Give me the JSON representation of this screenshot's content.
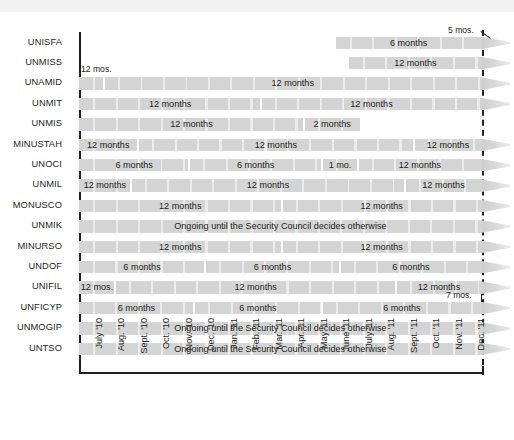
{
  "chart_data": {
    "type": "bar",
    "title": "",
    "subtitle": "",
    "xlabel": "",
    "ylabel": "",
    "orientation": "horizontal-gantt",
    "grid": false,
    "legend": "none",
    "x_axis": {
      "start": "July '10",
      "end": "Dec. '11",
      "tick_labels": [
        "July '10",
        "Aug. '10",
        "Sept. '10",
        "Oct. '10",
        "Nov. '10",
        "Dec. '10",
        "Jan. '11",
        "Feb. '11",
        "Mar. '11",
        "Apr. '11",
        "May '11",
        "June '11",
        "July '11",
        "Aug. '11",
        "Sept. '11",
        "Oct. '11",
        "Nov. '11",
        "Dec. '11"
      ]
    },
    "now_marker": {
      "label": "Dec. '11",
      "style": "dashed-vertical"
    },
    "categories": [
      "UNISFA",
      "UNMISS",
      "UNAMID",
      "UNMIT",
      "UNMIS",
      "MINUSTAH",
      "UNOCI",
      "UNMIL",
      "MONUSCO",
      "UNMIK",
      "MINURSO",
      "UNDOF",
      "UNIFIL",
      "UNFICYP",
      "UNMOGIP",
      "UNTSO"
    ],
    "rows": [
      {
        "mission": "UNISFA",
        "callout": {
          "text": "5 mos.",
          "leader": true
        },
        "continues": true,
        "segments": [
          {
            "label": "6 months",
            "start_month": 11.4,
            "end_month": 17.9,
            "months": 6
          }
        ]
      },
      {
        "mission": "UNMISS",
        "continues": true,
        "segments": [
          {
            "label": "12 months",
            "start_month": 12.0,
            "end_month": 17.9,
            "months": 12
          }
        ]
      },
      {
        "mission": "UNAMID",
        "callout": {
          "text": "12 mos.",
          "leader": false
        },
        "continues": true,
        "segments": [
          {
            "label": "",
            "start_month": 0.0,
            "end_month": 1.1,
            "months": 12
          },
          {
            "label": "12 months",
            "start_month": 1.1,
            "end_month": 17.9,
            "months": 12
          }
        ]
      },
      {
        "mission": "UNMIT",
        "continues": true,
        "segments": [
          {
            "label": "12 months",
            "start_month": 0.0,
            "end_month": 8.1,
            "months": 12
          },
          {
            "label": "12 months",
            "start_month": 8.1,
            "end_month": 17.9,
            "months": 12
          }
        ]
      },
      {
        "mission": "UNMIS",
        "continues": false,
        "segments": [
          {
            "label": "12 months",
            "start_month": 0.0,
            "end_month": 10.0,
            "months": 12
          },
          {
            "label": "2 months",
            "start_month": 10.0,
            "end_month": 12.5,
            "months": 2
          }
        ]
      },
      {
        "mission": "MINUSTAH",
        "continues": true,
        "segments": [
          {
            "label": "12 months",
            "start_month": 0.0,
            "end_month": 2.6,
            "months": 12
          },
          {
            "label": "12 months",
            "start_month": 2.6,
            "end_month": 14.9,
            "months": 12
          },
          {
            "label": "12 months",
            "start_month": 14.9,
            "end_month": 17.9,
            "months": 12
          }
        ]
      },
      {
        "mission": "UNOCI",
        "continues": true,
        "segments": [
          {
            "label": "6 months",
            "start_month": 0.0,
            "end_month": 4.9,
            "months": 6
          },
          {
            "label": "6 months",
            "start_month": 4.9,
            "end_month": 10.8,
            "months": 6
          },
          {
            "label": "1 mo.",
            "start_month": 10.8,
            "end_month": 12.4,
            "months": 1
          },
          {
            "label": "12 months",
            "start_month": 12.4,
            "end_month": 17.9,
            "months": 12
          }
        ]
      },
      {
        "mission": "UNMIL",
        "continues": true,
        "segments": [
          {
            "label": "12 months",
            "start_month": 0.0,
            "end_month": 2.3,
            "months": 12
          },
          {
            "label": "12 months",
            "start_month": 2.3,
            "end_month": 14.5,
            "months": 12
          },
          {
            "label": "12 months",
            "start_month": 14.5,
            "end_month": 17.9,
            "months": 12
          }
        ]
      },
      {
        "mission": "MONUSCO",
        "continues": true,
        "segments": [
          {
            "label": "12 months",
            "start_month": 0.0,
            "end_month": 9.0,
            "months": 12
          },
          {
            "label": "12 months",
            "start_month": 9.0,
            "end_month": 17.9,
            "months": 12
          }
        ]
      },
      {
        "mission": "UNMIK",
        "continues": true,
        "segments": [
          {
            "label": "Ongoing until the Security Council decides otherwise",
            "start_month": 0.0,
            "end_month": 17.9,
            "months": null
          }
        ]
      },
      {
        "mission": "MINURSO",
        "continues": true,
        "segments": [
          {
            "label": "12 months",
            "start_month": 0.0,
            "end_month": 9.0,
            "months": 12
          },
          {
            "label": "12 months",
            "start_month": 9.0,
            "end_month": 17.9,
            "months": 12
          }
        ]
      },
      {
        "mission": "UNDOF",
        "continues": true,
        "segments": [
          {
            "label": "6 months",
            "start_month": 0.0,
            "end_month": 5.6,
            "months": 6
          },
          {
            "label": "6 months",
            "start_month": 5.6,
            "end_month": 11.6,
            "months": 6
          },
          {
            "label": "6 months",
            "start_month": 11.6,
            "end_month": 17.9,
            "months": 6
          }
        ]
      },
      {
        "mission": "UNIFIL",
        "continues": true,
        "segments": [
          {
            "label": "12 mos.",
            "start_month": 0.0,
            "end_month": 1.6,
            "months": 12
          },
          {
            "label": "12 months",
            "start_month": 1.6,
            "end_month": 14.1,
            "months": 12
          },
          {
            "label": "12 months",
            "start_month": 14.1,
            "end_month": 17.9,
            "months": 12
          }
        ]
      },
      {
        "mission": "UNFICYP",
        "callout": {
          "text": "7 mos.",
          "leader": false
        },
        "continues": true,
        "segments": [
          {
            "label": "6 months",
            "start_month": 0.0,
            "end_month": 5.1,
            "months": 6
          },
          {
            "label": "6 months",
            "start_month": 5.1,
            "end_month": 10.8,
            "months": 6
          },
          {
            "label": "6 months",
            "start_month": 10.8,
            "end_month": 17.9,
            "months": 6
          }
        ]
      },
      {
        "mission": "UNMOGIP",
        "continues": true,
        "segments": [
          {
            "label": "Ongoing until the Security Council decides otherwise",
            "start_month": 0.0,
            "end_month": 17.9,
            "months": null
          }
        ]
      },
      {
        "mission": "UNTSO",
        "continues": true,
        "segments": [
          {
            "label": "Ongoing until the Security Council decides otherwise",
            "start_month": 0.0,
            "end_month": 17.9,
            "months": null
          }
        ]
      }
    ]
  },
  "colors": {
    "bar": "#d4d4d4",
    "text": "#231f20",
    "axis": "#231f20",
    "top_band": "#f2f2f2",
    "background": "#ffffff"
  }
}
